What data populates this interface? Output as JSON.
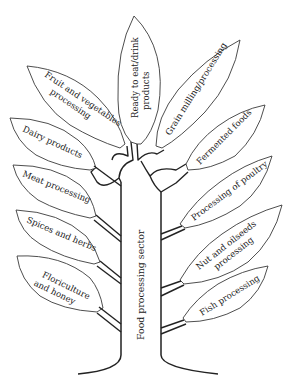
{
  "diagram": {
    "type": "tree",
    "trunk": {
      "label": "Food processing sector"
    },
    "branches_left": [
      {
        "id": "fruit-veg",
        "lines": [
          "Fruit and vegetables",
          "processing"
        ]
      },
      {
        "id": "dairy",
        "lines": [
          "Dairy products"
        ]
      },
      {
        "id": "meat",
        "lines": [
          "Meat processing"
        ]
      },
      {
        "id": "spices",
        "lines": [
          "Spices and herbs"
        ]
      },
      {
        "id": "floriculture",
        "lines": [
          "Floriculture",
          "and honey"
        ]
      }
    ],
    "branch_top": {
      "id": "ready-to-eat",
      "lines": [
        "Ready to eat/drink",
        "products"
      ]
    },
    "branches_right": [
      {
        "id": "grain",
        "lines": [
          "Grain milling/processing"
        ]
      },
      {
        "id": "fermented",
        "lines": [
          "Fermented foods"
        ]
      },
      {
        "id": "poultry",
        "lines": [
          "Processing of poultry"
        ]
      },
      {
        "id": "nut-oilseed",
        "lines": [
          "Nut and oilseeds",
          "processing"
        ]
      },
      {
        "id": "fish",
        "lines": [
          "Fish processing"
        ]
      }
    ],
    "colors": {
      "stroke": "#222222",
      "background": "#ffffff"
    }
  }
}
